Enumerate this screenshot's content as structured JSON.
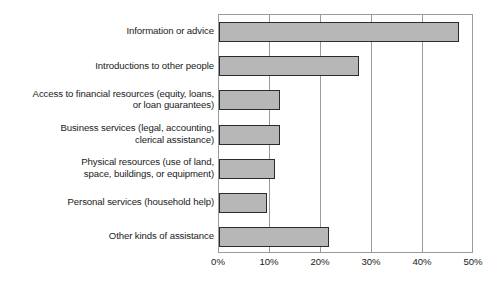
{
  "chart_data": {
    "type": "bar",
    "orientation": "horizontal",
    "title": "",
    "subtitle": "",
    "xlabel": "",
    "ylabel": "",
    "xlim": [
      0,
      50
    ],
    "xtick_labels": [
      "0%",
      "10%",
      "20%",
      "30%",
      "40%",
      "50%"
    ],
    "xtick_values": [
      0,
      10,
      20,
      30,
      40,
      50
    ],
    "grid": true,
    "legend": null,
    "categories": [
      "Information or advice",
      "Introductions to other people",
      "Access to financial resources (equity, loans,\nor loan guarantees)",
      "Business services (legal, accounting,\nclerical assistance)",
      "Physical resources (use of land,\nspace, buildings, or equipment)",
      "Personal services (household help)",
      "Other kinds of assistance"
    ],
    "values": [
      47.0,
      27.5,
      12.0,
      12.0,
      11.0,
      9.5,
      21.5
    ],
    "bar_fill_color": "#b7b7b7",
    "bar_edge_color": "#2b2b2b",
    "axis_color": "#9a9a9a",
    "background_color": "#ffffff"
  }
}
